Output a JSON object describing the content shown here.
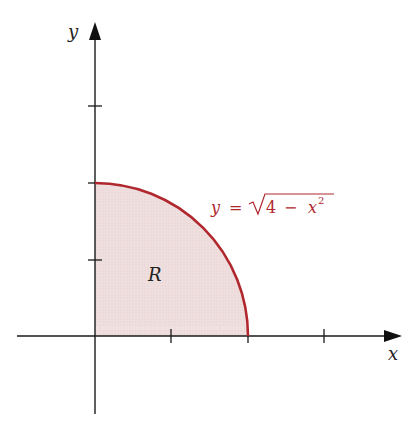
{
  "figure": {
    "type": "region-under-curve",
    "axes": {
      "x_label": "x",
      "y_label": "y",
      "x_ticks": [
        1,
        2,
        3
      ],
      "y_ticks": [
        1,
        2,
        3
      ]
    },
    "curve": {
      "equation_lhs": "y",
      "equals": "=",
      "radicand_const": "4",
      "minus": "−",
      "radicand_var": "x",
      "exponent": "2",
      "color": "#b0282e"
    },
    "region": {
      "label": "R",
      "fill_color": "#eedcdc"
    },
    "colors": {
      "axis": "#1a1a1a",
      "equation_text": "#b0282e"
    }
  }
}
